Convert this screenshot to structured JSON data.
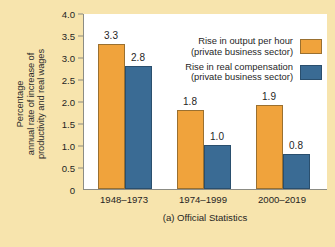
{
  "chart_data": {
    "type": "bar",
    "title": "",
    "caption": "(a) Official Statistics",
    "xlabel": "",
    "ylabel": "Percentage annual rate of increase of productivity and real wages",
    "ylabel_lines": [
      "Percentage",
      "annual rate of increase of",
      "productivity and real wages"
    ],
    "categories": [
      "1948–1973",
      "1974–1999",
      "2000–2019"
    ],
    "series": [
      {
        "name": "Rise in output per hour (private business sector)",
        "name_lines": [
          "Rise in output per hour",
          "(private business sector)"
        ],
        "color": "#f0a33c",
        "values": [
          3.3,
          1.8,
          1.9
        ],
        "value_labels": [
          "3.3",
          "1.8",
          "1.9"
        ]
      },
      {
        "name": "Rise in real compensation (private business sector)",
        "name_lines": [
          "Rise in real compensation",
          "(private business sector)"
        ],
        "color": "#3a6b94",
        "values": [
          2.8,
          1.0,
          0.8
        ],
        "value_labels": [
          "2.8",
          "1.0",
          "0.8"
        ]
      }
    ],
    "ylim": [
      0,
      4.0
    ],
    "ytick_values": [
      0,
      0.5,
      1.0,
      1.5,
      2.0,
      2.5,
      3.0,
      3.5,
      4.0
    ],
    "ytick_labels": [
      "0",
      "0.5",
      "1.0",
      "1.5",
      "2.0",
      "2.5",
      "3.0",
      "3.5",
      "4.0"
    ],
    "grid": false,
    "legend_position": "top-right",
    "background_color": "#f7e4ad",
    "plot_background_color": "#ffffff",
    "axis_color": "#8c8c84"
  }
}
